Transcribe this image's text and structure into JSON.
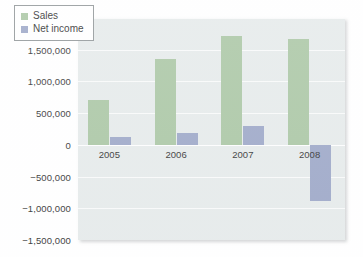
{
  "chart_data": {
    "type": "bar",
    "title": "",
    "subtitle": "",
    "xlabel": "",
    "ylabel": "",
    "categories": [
      "2005",
      "2006",
      "2007",
      "2008"
    ],
    "series": [
      {
        "name": "Sales",
        "color": "#a8c5a2",
        "values": [
          700000,
          1360000,
          1720000,
          1670000
        ]
      },
      {
        "name": "Net income",
        "color": "#9aa5c6",
        "values": [
          120000,
          190000,
          290000,
          -890000
        ]
      }
    ],
    "ylim": [
      -1500000,
      2000000
    ],
    "ytick_values": [
      2000000,
      1500000,
      1000000,
      500000,
      0,
      -500000,
      -1000000,
      -1500000
    ],
    "ytick_labels": [
      "2,000,000",
      "1,500,000",
      "1,000,000",
      "500,000",
      "0",
      "−500,000",
      "−1,000,000",
      "−1,500,000"
    ],
    "grid": true,
    "legend_position": "top-left",
    "plot_background": "#e5eaea",
    "figure_background": "#ffffff"
  },
  "legend": {
    "items": [
      {
        "label": "Sales",
        "swatch": "legend-swatch-sales"
      },
      {
        "label": "Net income",
        "swatch": "legend-swatch-net-income"
      }
    ]
  }
}
